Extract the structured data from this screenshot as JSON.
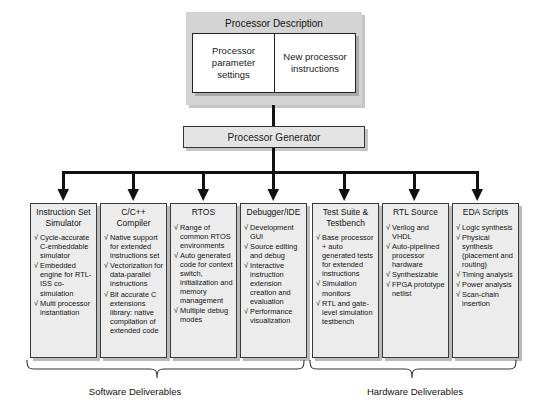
{
  "diagram": {
    "colors": {
      "panel_gray": "#d4d4d4",
      "box_gray": "#ececec",
      "generator_gray": "#e4e4e4",
      "line_black": "#111111",
      "text": "#1a1a1a"
    }
  },
  "description_panel": {
    "title": "Processor Description",
    "cells": [
      {
        "label": "Processor\nparameter\nsettings"
      },
      {
        "label": "New\nprocessor\ninstructions"
      }
    ]
  },
  "generator": {
    "label": "Processor Generator"
  },
  "bullet_glyph": "√",
  "columns": [
    {
      "title": "Instruction Set\nSimulator",
      "items": [
        "Cycle-accurate C-embeddable simulator",
        "Embedded engine for RTL-ISS co-simulation",
        "Multi processor instantiation"
      ]
    },
    {
      "title": "C/C++\nCompiler",
      "items": [
        "Native support for extended instructions set",
        "Vectorization for data-parallel instructions",
        "Bit accurate C extensions library: native compilation of extended code"
      ]
    },
    {
      "title": "RTOS",
      "items": [
        "Range of common RTOS environments",
        "Auto generated code for context switch, initialization and memory management",
        "Multiple debug modes"
      ]
    },
    {
      "title": "Debugger/IDE",
      "items": [
        "Development GUI",
        "Source editing and debug",
        "Interactive instruction extension creation and evaluation",
        "Performance visualization"
      ]
    },
    {
      "title": "Test Suite &\nTestbench",
      "items": [
        "Base processor + auto generated tests for extended instructions",
        "Simulation monitors",
        "RTL and gate-level simulation testbench"
      ]
    },
    {
      "title": "RTL Source",
      "items": [
        "Verilog and VHDL",
        "Auto-pipelined processor hardware",
        "Synthesizable",
        "FPGA prototype netlist"
      ]
    },
    {
      "title": "EDA Scripts",
      "items": [
        "Logic synthesis",
        "Physical synthesis (placement and routing)",
        "Timing analysis",
        "Power analysis",
        "Scan-chain insertion"
      ]
    }
  ],
  "groups": [
    {
      "label": "Software Deliverables"
    },
    {
      "label": "Hardware Deliverables"
    }
  ]
}
